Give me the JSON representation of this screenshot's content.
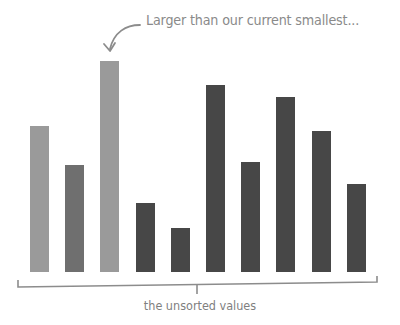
{
  "annotation": {
    "text": "Larger than our current smallest...",
    "arrow_icon": "curved-arrow-down-left"
  },
  "caption": {
    "text": "the unsorted values"
  },
  "colors": {
    "light_bar": "#9a9a9a",
    "medium_bar": "#6f6f6f",
    "dark_bar": "#474747",
    "bracket": "#8c8c8c",
    "annotation_text": "#8a8a8a"
  },
  "chart_data": {
    "type": "bar",
    "title": "",
    "xlabel": "the unsorted values",
    "ylabel": "",
    "categories": [
      "1",
      "2",
      "3",
      "4",
      "5",
      "6",
      "7",
      "8",
      "9",
      "10"
    ],
    "values": [
      146,
      107,
      211,
      69,
      44,
      187,
      110,
      175,
      141,
      88
    ],
    "bar_states": [
      "light",
      "medium",
      "light",
      "dark",
      "dark",
      "dark",
      "dark",
      "dark",
      "dark",
      "dark"
    ],
    "annotations": [
      {
        "text": "Larger than our current smallest...",
        "points_to_index": 2
      }
    ],
    "grid": false,
    "legend": null
  }
}
